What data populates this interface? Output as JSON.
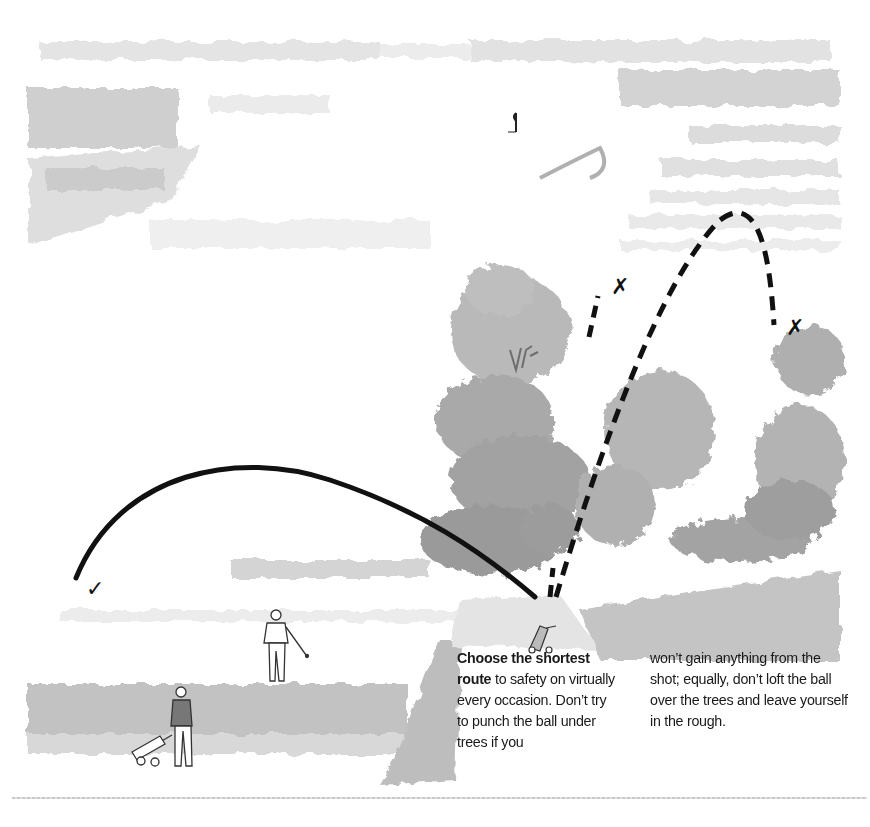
{
  "illustration": {
    "description": "Watercolor golf course scene: golfer stuck behind trees with three possible shot routes",
    "markers": [
      {
        "symbol": "✓",
        "meaning": "good shot - shortest route to safety",
        "position": "left, fairway"
      },
      {
        "symbol": "✗",
        "meaning": "bad shot - punch under trees",
        "position": "center behind tree"
      },
      {
        "symbol": "✗",
        "meaning": "bad shot - loft over trees into rough",
        "position": "right, rough"
      }
    ],
    "figures": [
      "golfer with club on fairway",
      "golfer with pull trolley",
      "golf bag trolley near ball",
      "flag on green"
    ],
    "colors": {
      "trajectory": "#111111",
      "wash_light": "#e6e6e6",
      "wash_mid": "#bdbdbd",
      "wash_dark": "#9a9a9a"
    }
  },
  "caption": {
    "col1": {
      "bold": "Choose the shortest route",
      "text": " to safety on virtually every occasion. Don’t try to punch the ball under trees if you"
    },
    "col2": {
      "text": "won’t gain anything from the shot; equally, don’t loft the ball over the trees and leave yourself in the rough."
    }
  }
}
